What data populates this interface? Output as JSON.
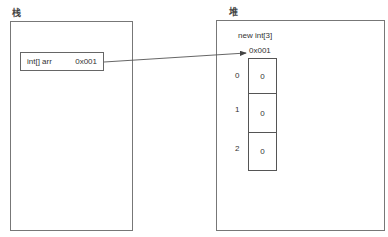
{
  "stack": {
    "label": "栈",
    "variable": {
      "type_name": "int[] arr",
      "value": "0x001"
    }
  },
  "heap": {
    "label": "堆",
    "object": {
      "expression": "new int[3]",
      "address": "0x001",
      "cells": [
        {
          "index": "0",
          "value": "0"
        },
        {
          "index": "1",
          "value": "0"
        },
        {
          "index": "2",
          "value": "0"
        }
      ]
    }
  },
  "reference_arrow": {
    "from": "stack.variable",
    "to": "heap.object"
  }
}
